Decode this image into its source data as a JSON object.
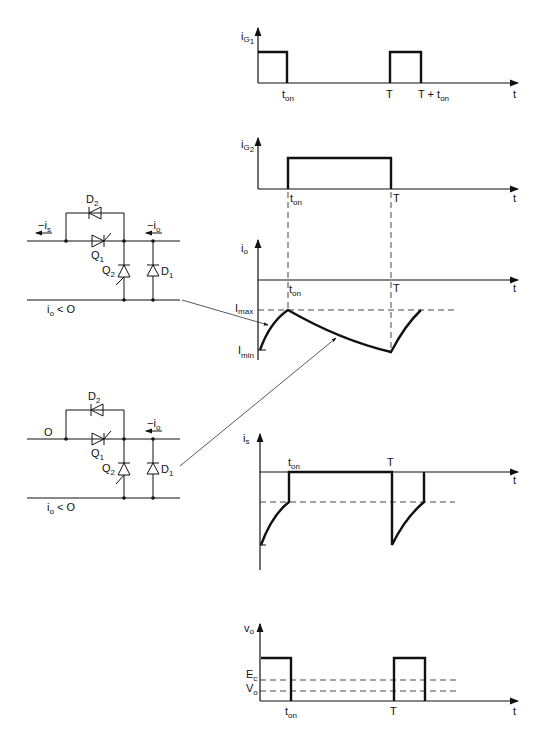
{
  "figure": {
    "type": "chopper-circuit-waveforms",
    "plots": {
      "ig1": {
        "ylabel": "i",
        "ylabel_sub": "G1",
        "xlabel": "t",
        "ticks": [
          "t_on",
          "T",
          "T + t_on"
        ]
      },
      "ig2": {
        "ylabel": "i",
        "ylabel_sub": "G2",
        "xlabel": "t",
        "ticks": [
          "t_on",
          "T"
        ]
      },
      "io": {
        "ylabel": "i",
        "ylabel_sub": "o",
        "xlabel": "t",
        "ticks": [
          "t_on",
          "T"
        ],
        "levels": [
          "I_max",
          "I_min"
        ]
      },
      "is": {
        "ylabel": "i",
        "ylabel_sub": "s",
        "xlabel": "t",
        "ticks": [
          "t_on",
          "T"
        ]
      },
      "vo": {
        "ylabel": "v",
        "ylabel_sub": "o",
        "xlabel": "t",
        "ticks": [
          "t_on",
          "T"
        ],
        "levels": [
          "E_c",
          "V_o"
        ]
      }
    },
    "circuits": [
      {
        "id": "top",
        "left_label": "-i_s",
        "right_label": "-i_o",
        "bottom_label": "i_o < 0",
        "components": [
          "D2",
          "Q1",
          "Q2",
          "D1"
        ]
      },
      {
        "id": "bottom",
        "left_label": "0",
        "right_label": "-i_o",
        "bottom_label": "i_o < 0",
        "components": [
          "D2",
          "Q1",
          "Q2",
          "D1"
        ]
      }
    ]
  },
  "labels": {
    "i": "i",
    "v": "v",
    "t": "t",
    "G1": "G",
    "G1n": "1",
    "G2": "G",
    "G2n": "2",
    "o": "o",
    "s": "s",
    "ton_t": "t",
    "ton_sub": "on",
    "T": "T",
    "Tplus": "T + t",
    "Imax": "I",
    "Imax_sub": "max",
    "Imin": "I",
    "Imin_sub": "min",
    "Ec": "E",
    "Ec_sub": "c",
    "Vo": "V",
    "Vo_sub": "o",
    "D": "D",
    "Q": "Q",
    "n1": "1",
    "n2": "2",
    "minus_i": "−i",
    "zero": "O",
    "io_lt0": "i",
    "lt0": " < O"
  }
}
